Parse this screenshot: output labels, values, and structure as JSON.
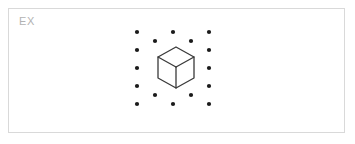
{
  "canvas": {
    "width": 355,
    "height": 144,
    "background": "#ffffff"
  },
  "card": {
    "label": "EX",
    "label_color": "#b3b3b3",
    "border_color": "#d9d9d9",
    "background": "#ffffff",
    "x": 8,
    "y": 8,
    "width": 337,
    "height": 125
  },
  "figure": {
    "name": "isometric-cube-in-dot-lattice",
    "dot_color": "#1a1a1a",
    "dot_radius": 2.1,
    "cube_stroke": "#3a3a3a",
    "cube_fill": "#ffffff",
    "cube_stroke_width": 1.3,
    "dots": [
      {
        "x": 128,
        "y": 23
      },
      {
        "x": 164,
        "y": 23
      },
      {
        "x": 200,
        "y": 23
      },
      {
        "x": 146,
        "y": 32
      },
      {
        "x": 182,
        "y": 32
      },
      {
        "x": 128,
        "y": 41
      },
      {
        "x": 200,
        "y": 41
      },
      {
        "x": 128,
        "y": 59
      },
      {
        "x": 200,
        "y": 59
      },
      {
        "x": 128,
        "y": 77
      },
      {
        "x": 200,
        "y": 77
      },
      {
        "x": 146,
        "y": 86
      },
      {
        "x": 182,
        "y": 86
      },
      {
        "x": 128,
        "y": 95
      },
      {
        "x": 164,
        "y": 95
      },
      {
        "x": 200,
        "y": 95
      }
    ],
    "cube": {
      "top_apex": {
        "x": 167,
        "y": 38
      },
      "left_upper": {
        "x": 149,
        "y": 48
      },
      "right_upper": {
        "x": 185,
        "y": 48
      },
      "center": {
        "x": 167,
        "y": 58
      },
      "left_lower": {
        "x": 149,
        "y": 69
      },
      "right_lower": {
        "x": 185,
        "y": 69
      },
      "bottom_apex": {
        "x": 167,
        "y": 79
      },
      "outline_path": "M167,38 L185,48 L185,69 L167,79 L149,69 L149,48 Z",
      "inner_edges": [
        "M149,48 L167,58",
        "M185,48 L167,58",
        "M167,58 L167,79"
      ]
    }
  }
}
